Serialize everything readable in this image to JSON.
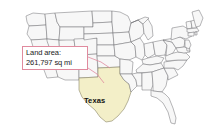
{
  "map": {
    "title": "United States map with Texas highlighted",
    "background_color": "#ffffff",
    "state_fill": "#f7f7f7",
    "state_border": "#6e6e72",
    "highlight_state": "Texas",
    "highlight_fill": "#f3efc8",
    "highlight_border": "#8a8464"
  },
  "callout": {
    "label_line1": "Land area:",
    "label_line2": "261,797 sq mi",
    "border_color": "#e08a9e",
    "leader_color": "#e08a9e",
    "background_color": "#ffffff"
  },
  "labels": {
    "texas": "Texas"
  }
}
